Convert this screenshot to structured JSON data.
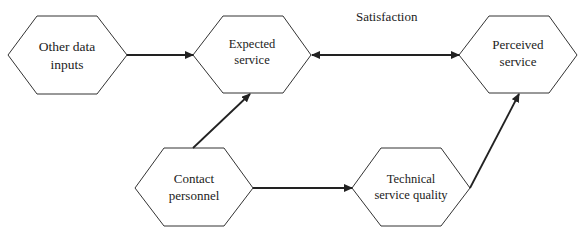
{
  "diagram": {
    "type": "flow-diagram",
    "nodes": [
      {
        "id": "other",
        "label_line1": "Other data",
        "label_line2": "inputs"
      },
      {
        "id": "expected",
        "label_line1": "Expected",
        "label_line2": "service"
      },
      {
        "id": "perceived",
        "label_line1": "Perceived",
        "label_line2": "service"
      },
      {
        "id": "contact",
        "label_line1": "Contact",
        "label_line2": "personnel"
      },
      {
        "id": "technical",
        "label_line1": "Technical",
        "label_line2": "service quality"
      }
    ],
    "edges": [
      {
        "from": "other",
        "to": "expected",
        "type": "arrow"
      },
      {
        "from": "expected",
        "to": "perceived",
        "type": "double-arrow",
        "label": "Satisfaction"
      },
      {
        "from": "contact",
        "to": "expected",
        "type": "arrow"
      },
      {
        "from": "contact",
        "to": "technical",
        "type": "arrow"
      },
      {
        "from": "technical",
        "to": "perceived",
        "type": "arrow"
      }
    ],
    "satisfaction_label": "Satisfaction",
    "colors": {
      "stroke": "#222222",
      "background": "#ffffff"
    }
  }
}
